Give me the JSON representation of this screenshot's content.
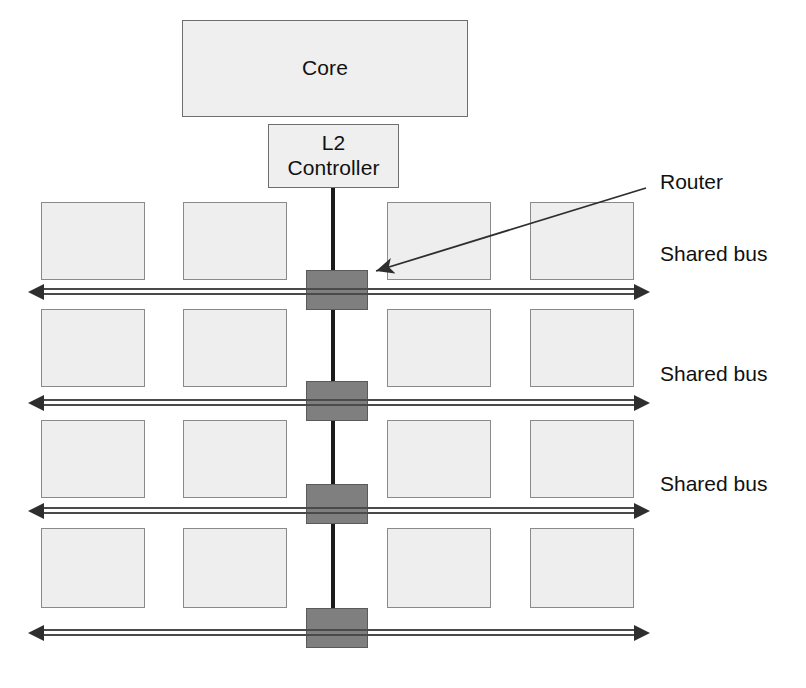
{
  "diagram": {
    "title_nodes": {
      "core": {
        "label": "Core"
      },
      "l2_controller": {
        "label": "L2\nController"
      }
    },
    "annotations": {
      "router_callout": "Router",
      "bus_labels": [
        "Shared bus",
        "Shared bus",
        "Shared bus"
      ]
    },
    "colors": {
      "tile_fill": "#eeeeee",
      "tile_border": "#8a8a8a",
      "router_fill": "#7f7f7f",
      "router_border": "#5a5a5a",
      "bus_line": "#4a4a4a",
      "link_line": "#1a1a1a",
      "text": "#111111",
      "background": "#ffffff"
    },
    "structure": {
      "tile_rows": 4,
      "tiles_per_row": 4,
      "router_count": 4,
      "bus_count": 4,
      "labeled_bus_count": 3
    },
    "geometry": {
      "core": {
        "x": 182,
        "y": 20,
        "w": 286,
        "h": 97
      },
      "l2": {
        "x": 268,
        "y": 124,
        "w": 131,
        "h": 64
      },
      "vertical_link_x": 331,
      "tile_columns_x": [
        41,
        183,
        387,
        530
      ],
      "tile_width": 104,
      "tile_row_tops": [
        202,
        309,
        420,
        528
      ],
      "tile_row_heights": [
        78,
        78,
        78,
        80
      ],
      "router_x": 306,
      "router_w": 62,
      "router_tops": [
        270,
        381,
        484,
        608
      ],
      "router_h": 40,
      "bus_y": [
        291,
        402,
        510,
        632
      ],
      "bus_left": 42,
      "bus_right": 636,
      "bus_label_x": 660,
      "bus_label_y": [
        242,
        362,
        472
      ],
      "router_label_x": 660,
      "router_label_y": 170,
      "callout_line": {
        "x1": 646,
        "y1": 188,
        "x2": 376,
        "y2": 271
      }
    }
  }
}
